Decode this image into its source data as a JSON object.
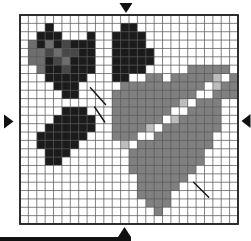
{
  "pattern_chart": {
    "description": "cross-stitch-pattern-grid-heart-rose-leaves",
    "grid": {
      "columns": 26,
      "rows": 25,
      "rows_pattern": [
        "..........................",
        "...K........KK............",
        "..KKK...K..KKKK...........",
        ".MKMKDKKK..KKKK...........",
        ".MMDMDDKK..KKKKK..........",
        ".MMKDMKKK..KKKKK..........",
        "..MKKDKKK..KKKK.....GGGGG.",
        "...KKKKK...KK..GG.GGGGGLWG",
        "....KKK.....GGGGGGGGGGWLGG",
        ".....KK....GGGGGGGGGGWWGGG",
        "...........GGGGGGGGLWGGG..",
        ".....KKK...GGGGGGGWWGGGG..",
        "....KKKKK..GGGGGGWLGGGGG..",
        "...KKKKKK..GGGGLWGGGGGGG..",
        "..KKKKKK...GGGWWGGGGGGG...",
        "..KKKKK.....LWGGGGGGGGG...",
        "...KKK......WGGGGGGGGG....",
        "...KK........GGGGGGGGG....",
        ".............GGGGGGGG.....",
        "..............GGGGGG......",
        "..............GGGGG.......",
        "..............GGGG........",
        "...............GGG........",
        "................G.........",
        ".........................."
      ]
    },
    "palette": {
      ".": {
        "name": "empty",
        "color": "none"
      },
      "K": {
        "name": "black-stitch",
        "color": "#1b1b1b"
      },
      "D": {
        "name": "dark-gray-stitch",
        "color": "#474747"
      },
      "M": {
        "name": "medium-gray-stitch",
        "color": "#6e6e6e"
      },
      "G": {
        "name": "heart-gray-stitch",
        "color": "#808080"
      },
      "L": {
        "name": "light-gray-stitch",
        "color": "#bdbdbd"
      },
      "W": {
        "name": "white-highlight-stitch",
        "color": "#ffffff"
      }
    },
    "backstitch_lines": [
      {
        "from_col": 8.4,
        "from_row": 8.7,
        "to_col": 10.2,
        "to_row": 10.7
      },
      {
        "from_col": 8.9,
        "from_row": 11.0,
        "to_col": 10.1,
        "to_row": 12.8
      },
      {
        "from_col": 20.7,
        "from_row": 20.0,
        "to_col": 22.5,
        "to_row": 21.8
      }
    ],
    "center_markers": [
      {
        "side": "top"
      },
      {
        "side": "bottom"
      },
      {
        "side": "left"
      },
      {
        "side": "right"
      }
    ],
    "colors": {
      "background": "#ffffff",
      "grid_line": "#5a5a5a",
      "grid_border": "#1f1f1f",
      "backstitch": "#1a1a1a",
      "marker": "#111111",
      "artifact_bar": "#111111"
    }
  }
}
